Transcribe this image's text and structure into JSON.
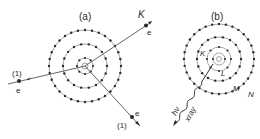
{
  "panels": {
    "a": {
      "label": "(a)",
      "incoming_index": "(1)",
      "incoming_particle": "e",
      "ejected_shell": "K",
      "ejected_particle": "e",
      "scattered_index": "(1)",
      "scattered_particle": "e"
    },
    "b": {
      "label": "(b)",
      "shells": [
        "K",
        "L",
        "M",
        "N"
      ],
      "photon_symbol": "hν",
      "photon_label": "xray"
    }
  },
  "colors": {
    "ink": "#2a2a2a",
    "line": "#555555",
    "background": "#ffffff"
  }
}
